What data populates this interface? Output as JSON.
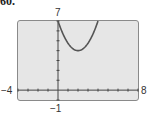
{
  "problem": {
    "label": "60."
  },
  "chart_data": {
    "type": "line",
    "title": "",
    "xlabel": "",
    "ylabel": "",
    "xlim": [
      -4,
      8
    ],
    "ylim": [
      -1,
      7
    ],
    "grid": false,
    "tick_labels": {
      "xmin": "−4",
      "xmax": "8",
      "ymin": "−1",
      "ymax": "7"
    },
    "series": [
      {
        "name": "parabola",
        "description": "Upward-opening parabola with vertex near (2, 4), passing (0, 7) and (4, 7)",
        "x": [
          0,
          0.5,
          1,
          1.5,
          2,
          2.5,
          3,
          3.5,
          4
        ],
        "y": [
          7,
          5.69,
          4.75,
          4.19,
          4,
          4.19,
          4.75,
          5.69,
          7
        ]
      }
    ],
    "colors": {
      "screen_bg": "#e6e6e6",
      "curve": "#555555",
      "axes": "#444444"
    }
  }
}
